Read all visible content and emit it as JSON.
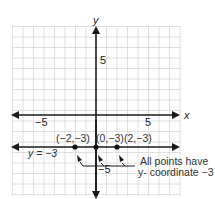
{
  "axes": {
    "x_label": "x",
    "y_label": "y",
    "x_tick_neg": "−5",
    "x_tick_pos": "5",
    "y_tick_pos": "5",
    "y_tick_neg": "−5"
  },
  "line": {
    "equation": "y = −3"
  },
  "points": [
    {
      "label": "(−2,−3)",
      "x": -2,
      "y": -3
    },
    {
      "label": "(0,−3)",
      "x": 0,
      "y": -3
    },
    {
      "label": "(2,−3)",
      "x": 2,
      "y": -3
    }
  ],
  "annotation": {
    "line1": "All points have",
    "line2": "y- coordinate −3"
  },
  "colors": {
    "grid": "#d8d8d8",
    "axis": "#1a1a1a"
  }
}
